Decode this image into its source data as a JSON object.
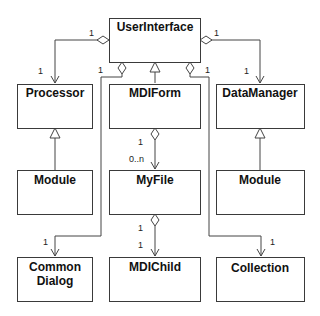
{
  "diagram": {
    "type": "UML class diagram",
    "classes": {
      "userinterface": "UserInterface",
      "processor": "Processor",
      "mdiform": "MDIForm",
      "datamanager": "DataManager",
      "module_left": "Module",
      "myfile": "MyFile",
      "module_right": "Module",
      "commondialog_line1": "Common",
      "commondialog_line2": "Dialog",
      "mdichild": "MDIChild",
      "collection": "Collection"
    },
    "relationships": [
      {
        "from": "UserInterface",
        "to": "Processor",
        "kind": "aggregation",
        "from_mult": "1",
        "to_mult": "1"
      },
      {
        "from": "UserInterface",
        "to": "DataManager",
        "kind": "aggregation",
        "from_mult": "1",
        "to_mult": "1"
      },
      {
        "from": "UserInterface",
        "to": "Common Dialog",
        "kind": "aggregation",
        "from_mult": "1",
        "to_mult": "1"
      },
      {
        "from": "UserInterface",
        "to": "Collection",
        "kind": "aggregation",
        "from_mult": "1",
        "to_mult": "1"
      },
      {
        "from": "MDIForm",
        "to": "UserInterface",
        "kind": "generalization"
      },
      {
        "from": "Module",
        "to": "Processor",
        "kind": "generalization"
      },
      {
        "from": "Module",
        "to": "DataManager",
        "kind": "generalization"
      },
      {
        "from": "MDIForm",
        "to": "MyFile",
        "kind": "aggregation",
        "from_mult": "1",
        "to_mult": "0..n"
      },
      {
        "from": "MyFile",
        "to": "MDIChild",
        "kind": "aggregation",
        "from_mult": "1",
        "to_mult": "1"
      }
    ],
    "multiplicities": {
      "ui_processor_from": "1",
      "ui_processor_to": "1",
      "ui_datamanager_from": "1",
      "ui_datamanager_to": "1",
      "ui_commondialog_from": "1",
      "ui_commondialog_to": "1",
      "ui_collection_from": "1",
      "ui_collection_to": "1",
      "mdiform_myfile_from": "1",
      "mdiform_myfile_to": "0..n",
      "myfile_mdichild_from": "1",
      "myfile_mdichild_to": "1"
    }
  }
}
